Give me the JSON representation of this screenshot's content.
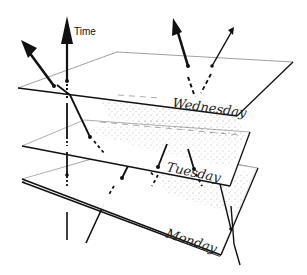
{
  "diagram": {
    "axis_label": "Time",
    "planes": [
      {
        "label": "Wednesday"
      },
      {
        "label": "Tuesday"
      },
      {
        "label": "Monday"
      }
    ],
    "colors": {
      "ink": "#111111",
      "plane_fill": "#ffffff",
      "stipple": "#555555"
    }
  }
}
